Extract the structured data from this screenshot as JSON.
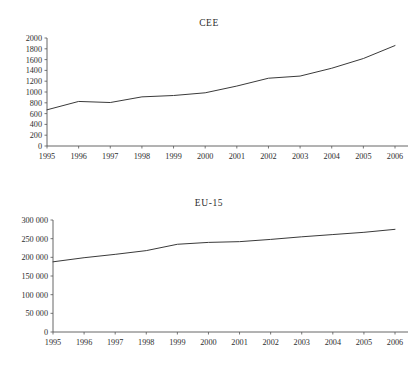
{
  "page": {
    "background_color": "#ffffff",
    "text_color": "#2e2e2e"
  },
  "charts": [
    {
      "id": "cee",
      "title": "CEE",
      "axis_color": "#555555",
      "line_color": "#3a3a3a"
    },
    {
      "id": "eu15",
      "title": "EU-15",
      "axis_color": "#555555",
      "line_color": "#3a3a3a"
    }
  ],
  "chart_data": [
    {
      "type": "line",
      "title": "CEE",
      "xlabel": "",
      "ylabel": "",
      "x": [
        1995,
        1996,
        1997,
        1998,
        1999,
        2000,
        2001,
        2002,
        2003,
        2004,
        2005,
        2006
      ],
      "categories": [
        "1995",
        "1996",
        "1997",
        "1998",
        "1999",
        "2000",
        "2001",
        "2002",
        "2003",
        "2004",
        "2005",
        "2006"
      ],
      "values": [
        670,
        825,
        805,
        910,
        935,
        985,
        1110,
        1255,
        1295,
        1440,
        1620,
        1860
      ],
      "ylim": [
        0,
        2000
      ],
      "yticks": [
        0,
        200,
        400,
        600,
        800,
        1000,
        1200,
        1400,
        1600,
        1800,
        2000
      ],
      "ytick_labels": [
        "0",
        "200",
        "400",
        "600",
        "800",
        "1000",
        "1200",
        "1400",
        "1600",
        "1800",
        "2000"
      ],
      "xlim": [
        1995,
        2006
      ],
      "grid": false,
      "legend": false,
      "legend_position": "none"
    },
    {
      "type": "line",
      "title": "EU-15",
      "xlabel": "",
      "ylabel": "",
      "x": [
        1995,
        1996,
        1997,
        1998,
        1999,
        2000,
        2001,
        2002,
        2003,
        2004,
        2005,
        2006
      ],
      "categories": [
        "1995",
        "1996",
        "1997",
        "1998",
        "1999",
        "2000",
        "2001",
        "2002",
        "2003",
        "2004",
        "2005",
        "2006"
      ],
      "values": [
        188000,
        199000,
        208000,
        218000,
        235000,
        240000,
        242000,
        248000,
        255000,
        261000,
        267000,
        275000
      ],
      "ylim": [
        0,
        300000
      ],
      "yticks": [
        0,
        50000,
        100000,
        150000,
        200000,
        250000,
        300000
      ],
      "ytick_labels": [
        "0",
        "50 000",
        "100 000",
        "150 000",
        "200 000",
        "250 000",
        "300 000"
      ],
      "xlim": [
        1995,
        2006
      ],
      "grid": false,
      "legend": false,
      "legend_position": "none"
    }
  ]
}
